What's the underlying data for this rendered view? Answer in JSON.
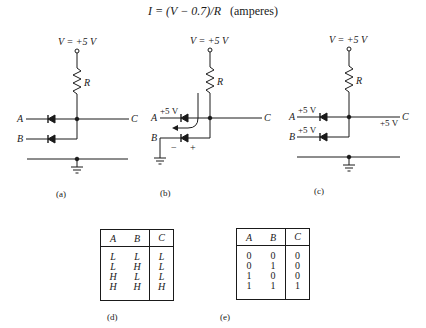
{
  "formula": {
    "text": "I = (V − 0.7)/R",
    "units": "(amperes)"
  },
  "circuits": {
    "a": {
      "supply_label": "V = +5 V",
      "resistor_label": "R",
      "input_a": "A",
      "input_b": "B",
      "output": "C",
      "caption": "(a)"
    },
    "b": {
      "supply_label": "V = +5 V",
      "resistor_label": "R",
      "input_a": "A",
      "input_a_voltage": "+5 V",
      "input_b": "B",
      "minus_sign": "−",
      "plus_sign": "+",
      "output": "C",
      "caption": "(b)"
    },
    "c": {
      "supply_label": "V = +5 V",
      "resistor_label": "R",
      "input_a": "A",
      "input_a_voltage": "+5 V",
      "input_b": "B",
      "input_b_voltage": "+5 V",
      "output": "C",
      "output_voltage": "+5 V",
      "caption": "(c)"
    }
  },
  "tables": {
    "d": {
      "headers": [
        "A",
        "B",
        "C"
      ],
      "rows": [
        [
          "L",
          "L",
          "L"
        ],
        [
          "L",
          "H",
          "L"
        ],
        [
          "H",
          "L",
          "L"
        ],
        [
          "H",
          "H",
          "H"
        ]
      ],
      "caption": "(d)"
    },
    "e": {
      "headers": [
        "A",
        "B",
        "C"
      ],
      "rows": [
        [
          "0",
          "0",
          "0"
        ],
        [
          "0",
          "1",
          "0"
        ],
        [
          "1",
          "0",
          "0"
        ],
        [
          "1",
          "1",
          "1"
        ]
      ],
      "caption": "(e)"
    }
  }
}
